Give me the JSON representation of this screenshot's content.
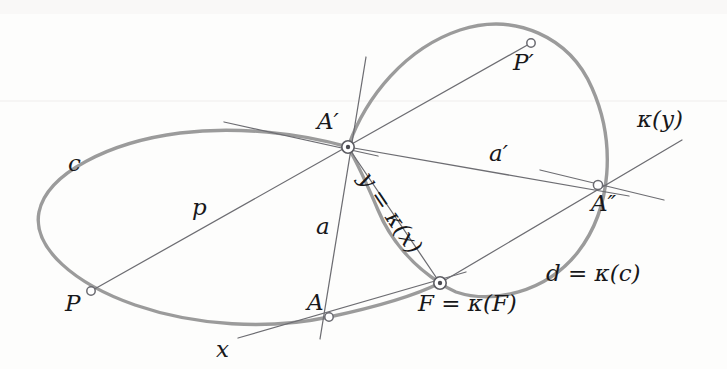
{
  "figure": {
    "kind": "geometry-diagram",
    "background_color": "#fdfdfc",
    "conic_color": "#9b9b9b",
    "line_color": "#6d6d72",
    "label_color": "#18181a"
  },
  "labels": {
    "c": "c",
    "p": "p",
    "a": "a",
    "a_prime": "a′",
    "x": "x",
    "y_eq_kappa_x": "y = κ(x)",
    "kappa_y": "κ(y)",
    "d_eq_kappa_c": "d = κ(c)",
    "P": "P",
    "P_prime": "P′",
    "A": "A",
    "A_prime": "A′",
    "A_double_prime": "A″",
    "F_eq_kappa_F": "F = κ(F)"
  },
  "points": [
    {
      "name": "P",
      "label": "P",
      "x": 91,
      "y": 291,
      "marker": "hollow"
    },
    {
      "name": "A",
      "label": "A",
      "x": 329,
      "y": 317,
      "marker": "hollow"
    },
    {
      "name": "A-prime",
      "label": "A′",
      "x": 348,
      "y": 147,
      "marker": "ring"
    },
    {
      "name": "P-prime",
      "label": "P′",
      "x": 531,
      "y": 43,
      "marker": "hollow"
    },
    {
      "name": "A-double-prime",
      "label": "A″",
      "x": 598,
      "y": 185,
      "marker": "hollow"
    },
    {
      "name": "F",
      "label": "F = κ(F)",
      "x": 440,
      "y": 283,
      "marker": "ring"
    }
  ],
  "conics": [
    {
      "name": "conic-c",
      "label": "c",
      "description": "left ellipse through P, A, A′, F"
    },
    {
      "name": "conic-d",
      "label": "d = κ(c)",
      "description": "right oval through A′, P′, A″, F"
    }
  ],
  "lines": [
    {
      "name": "line-p",
      "label": "p",
      "from": "P",
      "to": "P′"
    },
    {
      "name": "line-a",
      "label": "a",
      "from": "A",
      "to": "A′"
    },
    {
      "name": "line-a-prime",
      "label": "a′",
      "from": "A′",
      "to": "A″"
    },
    {
      "name": "line-x",
      "label": "x",
      "from": "A",
      "to": "F"
    },
    {
      "name": "line-y",
      "label": "y = κ(x)",
      "from": "A′",
      "to": "F"
    },
    {
      "name": "line-kappa-y",
      "label": "κ(y)",
      "from": "F",
      "to": "A″"
    },
    {
      "name": "tangent-at-A-prime",
      "label": "",
      "from": "A′",
      "to": ""
    },
    {
      "name": "tangent-at-A-double-prime",
      "label": "",
      "from": "A″",
      "to": ""
    }
  ]
}
